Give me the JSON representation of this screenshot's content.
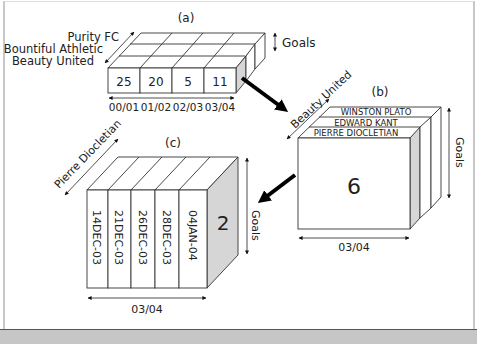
{
  "panels": {
    "a": {
      "label": "(a)",
      "teams": [
        "Purity FC",
        "Bountiful Athletic",
        "Beauty United"
      ],
      "values": [
        "25",
        "20",
        "5",
        "11"
      ],
      "seasons": [
        "00/01",
        "01/02",
        "02/03",
        "03/04"
      ],
      "measure": "Goals"
    },
    "b": {
      "label": "(b)",
      "team": "Beauty United",
      "players": [
        "WINSTON PLATO",
        "EDWARD KANT",
        "PIERRE DIOCLETIAN"
      ],
      "value": "6",
      "season": "03/04",
      "measure": "Goals"
    },
    "c": {
      "label": "(c)",
      "player": "Pierre Diocletian",
      "dates": [
        "14DEC-03",
        "21DEC-03",
        "26DEC-03",
        "28DEC-03",
        "04JAN-04"
      ],
      "value": "2",
      "season": "03/04",
      "measure": "Goals"
    }
  },
  "colors": {
    "shade": "#d6d6d6",
    "line": "#333333",
    "bar": "#c6c6c6"
  }
}
